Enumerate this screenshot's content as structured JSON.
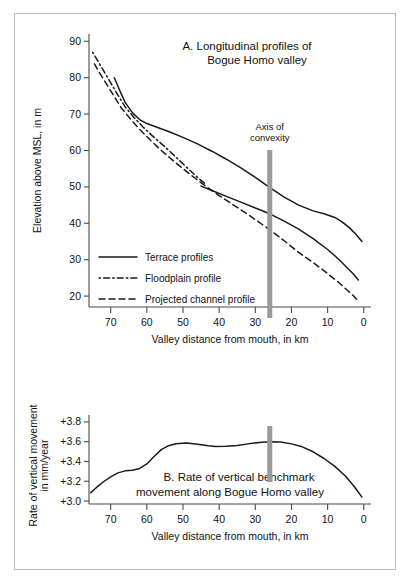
{
  "figure": {
    "panels": [
      "A",
      "B"
    ],
    "annotation": {
      "label_line1": "Axis of",
      "label_line2": "convexity",
      "position_km": 26
    }
  },
  "chart_data": [
    {
      "id": "panel-a",
      "type": "line",
      "title": "A.  Longitudinal profiles of",
      "title_line2": "Bogue Homo valley",
      "xlabel": "Valley distance from mouth,  in km",
      "ylabel": "Elevation above MSL, in m",
      "xlim": [
        76,
        -2
      ],
      "ylim": [
        17,
        92
      ],
      "xticks": [
        70,
        60,
        50,
        40,
        30,
        20,
        10,
        0
      ],
      "yticks": [
        90,
        80,
        70,
        60,
        50,
        40,
        30,
        20
      ],
      "xtick_labels": [
        "70",
        "60",
        "50",
        "40",
        "30",
        "20",
        "10",
        "0"
      ],
      "ytick_labels": [
        "90",
        "80",
        "70",
        "60",
        "50",
        "40",
        "30",
        "20"
      ],
      "grid": false,
      "legend_position": "lower-left",
      "series": [
        {
          "name": "Terrace profiles",
          "style": "solid",
          "traces": [
            {
              "comment": "upper terrace",
              "x": [
                69.0,
                67.5,
                66.0,
                64.0,
                62.0,
                60.0,
                57.0,
                54.0,
                50.0,
                46.0,
                42.0,
                38.0,
                34.0,
                30.0,
                26.0,
                22.0,
                18.0,
                14.0,
                11.0,
                8.0,
                6.0,
                4.0,
                2.0,
                0.5
              ],
              "y": [
                80.0,
                76.5,
                73.2,
                70.4,
                68.5,
                67.4,
                66.3,
                65.2,
                63.6,
                61.8,
                59.8,
                57.6,
                55.2,
                52.6,
                49.8,
                47.2,
                45.0,
                43.4,
                42.6,
                41.6,
                40.4,
                38.8,
                36.8,
                35.0
              ]
            },
            {
              "comment": "lower terrace",
              "x": [
                45.0,
                42.0,
                38.0,
                34.0,
                30.0,
                26.0,
                22.0,
                18.0,
                14.0,
                10.0,
                7.0,
                5.0,
                3.0,
                1.5
              ],
              "y": [
                50.2,
                49.0,
                47.4,
                45.8,
                44.2,
                42.6,
                40.6,
                38.4,
                35.8,
                32.8,
                30.2,
                28.2,
                26.2,
                24.4
              ]
            }
          ]
        },
        {
          "name": "Floodplain profile",
          "style": "dashdot",
          "traces": [
            {
              "x": [
                75.0,
                73.5,
                72.0,
                70.0,
                68.0,
                66.0,
                63.5,
                61.0,
                58.0,
                55.0,
                52.0,
                49.0,
                46.0,
                44.0
              ],
              "y": [
                87.0,
                84.5,
                82.0,
                78.6,
                75.2,
                72.0,
                69.0,
                66.4,
                63.6,
                61.0,
                58.2,
                55.4,
                52.6,
                51.0
              ]
            }
          ]
        },
        {
          "name": "Projected channel profile",
          "style": "dashed",
          "traces": [
            {
              "x": [
                74.5,
                73.0,
                71.0,
                69.0,
                67.0,
                64.5,
                62.0,
                59.0,
                56.0,
                52.0,
                48.0,
                44.0,
                40.0,
                36.0,
                32.0,
                28.0,
                26.0,
                22.0,
                18.0,
                14.0,
                10.0,
                7.0,
                5.0,
                3.0,
                1.5
              ],
              "y": [
                83.8,
                81.2,
                78.0,
                74.8,
                71.6,
                68.6,
                65.8,
                62.8,
                60.0,
                56.6,
                53.4,
                50.4,
                47.6,
                45.0,
                42.4,
                39.6,
                38.2,
                35.2,
                32.0,
                29.2,
                26.2,
                23.8,
                22.0,
                20.2,
                18.6
              ]
            }
          ]
        }
      ]
    },
    {
      "id": "panel-b",
      "type": "line",
      "title": "B.  Rate of vertical benchmark",
      "title_line2": "movement  along Bogue Homo valley",
      "xlabel": "Valley distance from mouth,  in km",
      "ylabel": "Rate of vertical movement\nin mm/year",
      "ylabel_line1": "Rate of vertical movement",
      "ylabel_line2": "in mm/year",
      "xlim": [
        76,
        -2
      ],
      "ylim": [
        2.97,
        3.87
      ],
      "xticks": [
        70,
        60,
        50,
        40,
        30,
        20,
        10,
        0
      ],
      "yticks": [
        3.8,
        3.6,
        3.4,
        3.2,
        3.0
      ],
      "xtick_labels": [
        "70",
        "60",
        "50",
        "40",
        "30",
        "20",
        "10",
        "0"
      ],
      "ytick_labels": [
        "+3.8",
        "+3.6",
        "+3.4",
        "+3.2",
        "+3.0"
      ],
      "grid": false,
      "series": [
        {
          "name": "Rate of vertical benchmark movement",
          "style": "solid",
          "traces": [
            {
              "x": [
                75.5,
                74.0,
                72.0,
                70.0,
                68.0,
                66.0,
                64.0,
                62.0,
                60.0,
                58.0,
                56.0,
                54.0,
                52.0,
                49.0,
                46.0,
                43.0,
                41.0,
                38.0,
                35.0,
                32.0,
                29.0,
                26.0,
                23.0,
                20.0,
                17.0,
                14.0,
                11.0,
                8.0,
                5.0,
                2.5,
                0.5
              ],
              "y": [
                3.085,
                3.135,
                3.195,
                3.245,
                3.285,
                3.305,
                3.312,
                3.33,
                3.375,
                3.45,
                3.52,
                3.56,
                3.58,
                3.588,
                3.575,
                3.558,
                3.552,
                3.553,
                3.562,
                3.578,
                3.592,
                3.6,
                3.596,
                3.578,
                3.548,
                3.498,
                3.43,
                3.35,
                3.25,
                3.14,
                3.04
              ]
            }
          ]
        }
      ]
    }
  ]
}
